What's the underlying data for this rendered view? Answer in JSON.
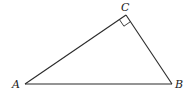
{
  "diagram": {
    "type": "right-triangle",
    "vertices": {
      "A": {
        "label": "A",
        "x": 25,
        "y": 84
      },
      "B": {
        "label": "B",
        "x": 172,
        "y": 84
      },
      "C": {
        "label": "C",
        "x": 126,
        "y": 15
      }
    },
    "right_angle_at": "C",
    "line_color": "#2a2a2a",
    "background": "#ffffff"
  }
}
